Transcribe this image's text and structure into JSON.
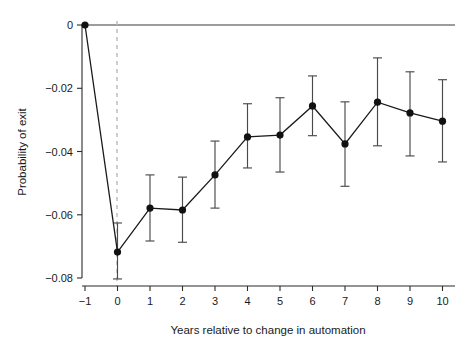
{
  "chart_data": {
    "type": "line",
    "title": "",
    "subtitle": "",
    "xlabel": "Years relative to change in automation",
    "ylabel": "Probability of exit",
    "x": [
      -1,
      0,
      1,
      2,
      3,
      4,
      5,
      6,
      7,
      8,
      9,
      10
    ],
    "xtick_labels": [
      "−1",
      "0",
      "1",
      "2",
      "3",
      "4",
      "5",
      "6",
      "7",
      "8",
      "9",
      "10"
    ],
    "ytick_labels": [
      "0",
      "−0.02",
      "−0.04",
      "−0.06",
      "−0.08"
    ],
    "ytick_values": [
      0,
      -0.02,
      -0.04,
      -0.06,
      -0.08
    ],
    "xlim": [
      -1.35,
      10.35
    ],
    "ylim": [
      -0.086,
      0.003
    ],
    "grid": false,
    "legend": null,
    "series": [
      {
        "name": "Probability of exit",
        "values": [
          0,
          -0.0718,
          -0.0579,
          -0.0585,
          -0.0474,
          -0.0354,
          -0.0348,
          -0.0256,
          -0.0376,
          -0.0244,
          -0.0278,
          -0.0304
        ],
        "err_low": [
          0,
          -0.0803,
          -0.0683,
          -0.0687,
          -0.0579,
          -0.0452,
          -0.0465,
          -0.035,
          -0.051,
          -0.0382,
          -0.0414,
          -0.0433
        ],
        "err_high": [
          0,
          -0.0626,
          -0.0474,
          -0.0481,
          -0.0367,
          -0.0249,
          -0.023,
          -0.0161,
          -0.0243,
          -0.0104,
          -0.0148,
          -0.0173
        ]
      }
    ],
    "annotations": [
      {
        "name": "event-reference-line",
        "type": "vline",
        "x": 0,
        "style": "dashed",
        "color": "#b9b9b9"
      },
      {
        "name": "zero-reference-line",
        "type": "hline",
        "y": 0,
        "style": "solid",
        "color": "#3a3a3a"
      }
    ]
  }
}
